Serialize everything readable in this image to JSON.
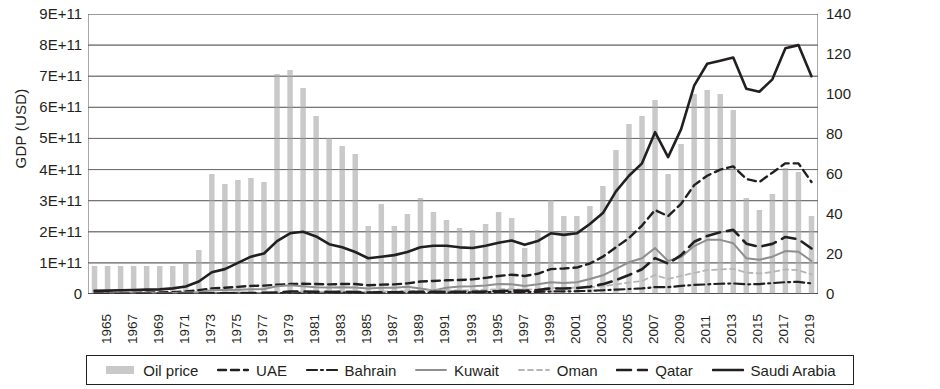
{
  "axes": {
    "y_left_title": "GDP (USD)",
    "y_right_title": "Oil price (USD @2020 prices)",
    "y_left_ticks": [
      "0",
      "1E+11",
      "2E+11",
      "3E+11",
      "4E+11",
      "5E+11",
      "6E+11",
      "7E+11",
      "8E+11",
      "9E+11"
    ],
    "y_right_ticks": [
      "0",
      "20",
      "40",
      "60",
      "80",
      "100",
      "120",
      "140"
    ],
    "x_ticks": [
      "1965",
      "1967",
      "1969",
      "1971",
      "1973",
      "1975",
      "1977",
      "1979",
      "1981",
      "1983",
      "1985",
      "1987",
      "1989",
      "1991",
      "1993",
      "1995",
      "1997",
      "1999",
      "2001",
      "2003",
      "2005",
      "2007",
      "2009",
      "2011",
      "2013",
      "2015",
      "2017",
      "2019"
    ]
  },
  "legend": {
    "items": [
      {
        "label": "Oil price",
        "style": "bar",
        "color": "#c9c9c9"
      },
      {
        "label": "UAE",
        "style": "dashed",
        "color": "#231f20"
      },
      {
        "label": "Bahrain",
        "style": "dashdot",
        "color": "#231f20"
      },
      {
        "label": "Kuwait",
        "style": "solid",
        "color": "#8f8f8f"
      },
      {
        "label": "Oman",
        "style": "dashed-light",
        "color": "#b5b5b5"
      },
      {
        "label": "Qatar",
        "style": "longdash",
        "color": "#231f20"
      },
      {
        "label": "Saudi Arabia",
        "style": "solid-thick",
        "color": "#231f20"
      }
    ]
  },
  "chart_data": {
    "type": "bar",
    "title": "",
    "xlabel": "",
    "ylabel": "GDP (USD)",
    "y2label": "Oil price (USD @2020 prices)",
    "ylim": [
      0,
      900000000000
    ],
    "y2lim": [
      0,
      140
    ],
    "grid": true,
    "legend_position": "bottom",
    "x": [
      1965,
      1966,
      1967,
      1968,
      1969,
      1970,
      1971,
      1972,
      1973,
      1974,
      1975,
      1976,
      1977,
      1978,
      1979,
      1980,
      1981,
      1982,
      1983,
      1984,
      1985,
      1986,
      1987,
      1988,
      1989,
      1990,
      1991,
      1992,
      1993,
      1994,
      1995,
      1996,
      1997,
      1998,
      1999,
      2000,
      2001,
      2002,
      2003,
      2004,
      2005,
      2006,
      2007,
      2008,
      2009,
      2010,
      2011,
      2012,
      2013,
      2014,
      2015,
      2016,
      2017,
      2018,
      2019,
      2020
    ],
    "bars": {
      "name": "Oil price",
      "axis": "right",
      "unit": "USD @2020 prices",
      "values": [
        14,
        14,
        14,
        14,
        14,
        14,
        14,
        15,
        22,
        60,
        55,
        57,
        58,
        56,
        110,
        112,
        103,
        89,
        78,
        74,
        70,
        34,
        45,
        34,
        40,
        48,
        41,
        37,
        33,
        32,
        35,
        41,
        38,
        23,
        32,
        47,
        39,
        39,
        44,
        54,
        72,
        85,
        89,
        97,
        60,
        75,
        100,
        102,
        100,
        92,
        48,
        42,
        50,
        63,
        61,
        39
      ]
    },
    "series": [
      {
        "name": "UAE",
        "axis": "left",
        "style": "dashed",
        "color": "#231f20",
        "values": [
          2000000000,
          2500000000,
          3000000000,
          3500000000,
          4000000000,
          5000000000,
          6000000000,
          8000000000,
          12000000000,
          18000000000,
          20000000000,
          23000000000,
          26000000000,
          27000000000,
          30000000000,
          32000000000,
          33000000000,
          32000000000,
          31000000000,
          32000000000,
          32000000000,
          28000000000,
          30000000000,
          31000000000,
          34000000000,
          40000000000,
          42000000000,
          44000000000,
          45000000000,
          47000000000,
          52000000000,
          58000000000,
          62000000000,
          58000000000,
          65000000000,
          80000000000,
          82000000000,
          85000000000,
          98000000000,
          120000000000,
          150000000000,
          180000000000,
          220000000000,
          270000000000,
          250000000000,
          290000000000,
          350000000000,
          380000000000,
          400000000000,
          410000000000,
          370000000000,
          360000000000,
          390000000000,
          420000000000,
          420000000000,
          360000000000
        ]
      },
      {
        "name": "Bahrain",
        "axis": "left",
        "style": "dashdot",
        "color": "#231f20",
        "values": [
          500000000,
          500000000,
          600000000,
          600000000,
          700000000,
          800000000,
          900000000,
          1000000000,
          1200000000,
          1800000000,
          2000000000,
          2300000000,
          2600000000,
          2800000000,
          3000000000,
          3500000000,
          3800000000,
          3900000000,
          4000000000,
          4100000000,
          4200000000,
          3800000000,
          4000000000,
          4200000000,
          4400000000,
          4800000000,
          5000000000,
          5200000000,
          5400000000,
          5600000000,
          6000000000,
          6500000000,
          6800000000,
          6500000000,
          7000000000,
          8000000000,
          8500000000,
          9000000000,
          10000000000,
          12000000000,
          14000000000,
          16000000000,
          18000000000,
          22000000000,
          22000000000,
          26000000000,
          29000000000,
          31000000000,
          33000000000,
          34000000000,
          31000000000,
          32000000000,
          35000000000,
          38000000000,
          39000000000,
          34000000000
        ]
      },
      {
        "name": "Kuwait",
        "axis": "left",
        "style": "solid",
        "color": "#8f8f8f",
        "values": [
          2000000000,
          2200000000,
          2400000000,
          2700000000,
          2900000000,
          3000000000,
          3500000000,
          4500000000,
          6000000000,
          12000000000,
          13000000000,
          14000000000,
          15000000000,
          16000000000,
          25000000000,
          28000000000,
          25000000000,
          22000000000,
          21000000000,
          22000000000,
          21000000000,
          18000000000,
          20000000000,
          20000000000,
          23000000000,
          18000000000,
          11000000000,
          20000000000,
          24000000000,
          25000000000,
          27000000000,
          32000000000,
          31000000000,
          26000000000,
          31000000000,
          38000000000,
          35000000000,
          38000000000,
          48000000000,
          60000000000,
          81000000000,
          102000000000,
          115000000000,
          148000000000,
          106000000000,
          119000000000,
          154000000000,
          174000000000,
          174000000000,
          163000000000,
          115000000000,
          110000000000,
          120000000000,
          138000000000,
          136000000000,
          106000000000
        ]
      },
      {
        "name": "Oman",
        "axis": "left",
        "style": "dashed-light",
        "color": "#b5b5b5",
        "values": [
          100000000,
          150000000,
          200000000,
          300000000,
          400000000,
          500000000,
          600000000,
          700000000,
          900000000,
          1800000000,
          2000000000,
          2300000000,
          2500000000,
          2600000000,
          3000000000,
          5900000000,
          6800000000,
          7000000000,
          7500000000,
          8000000000,
          9000000000,
          7000000000,
          8000000000,
          8000000000,
          9000000000,
          11000000000,
          11500000000,
          12000000000,
          11500000000,
          12000000000,
          13800000000,
          15300000000,
          15800000000,
          14000000000,
          16000000000,
          19500000000,
          19900000000,
          20300000000,
          21700000000,
          24800000000,
          31100000000,
          37000000000,
          42000000000,
          60900000000,
          48400000000,
          58600000000,
          67900000000,
          76700000000,
          78800000000,
          81100000000,
          68900000000,
          66000000000,
          70600000000,
          79300000000,
          76300000000,
          63400000000
        ]
      },
      {
        "name": "Qatar",
        "axis": "left",
        "style": "longdash",
        "color": "#231f20",
        "values": [
          100000000,
          150000000,
          200000000,
          250000000,
          300000000,
          400000000,
          500000000,
          700000000,
          1000000000,
          2400000000,
          2500000000,
          3000000000,
          3200000000,
          3500000000,
          4800000000,
          7800000000,
          8100000000,
          7400000000,
          6600000000,
          6700000000,
          6000000000,
          4800000000,
          5400000000,
          5400000000,
          6300000000,
          7400000000,
          6900000000,
          7100000000,
          7000000000,
          7200000000,
          8100000000,
          9100000000,
          11300000000,
          10400000000,
          12400000000,
          17800000000,
          17500000000,
          19400000000,
          23500000000,
          31700000000,
          44500000000,
          60900000000,
          79700000000,
          115300000000,
          97800000000,
          125100000000,
          167800000000,
          186800000000,
          198700000000,
          206200000000,
          161700000000,
          151700000000,
          161100000000,
          183300000000,
          175800000000,
          146400000000
        ]
      },
      {
        "name": "Saudi Arabia",
        "axis": "left",
        "style": "solid-thick",
        "color": "#231f20",
        "values": [
          10000000000,
          11000000000,
          12000000000,
          13000000000,
          14000000000,
          15000000000,
          18000000000,
          24000000000,
          40000000000,
          70000000000,
          80000000000,
          100000000000,
          120000000000,
          130000000000,
          170000000000,
          195000000000,
          200000000000,
          185000000000,
          160000000000,
          150000000000,
          135000000000,
          115000000000,
          120000000000,
          125000000000,
          135000000000,
          150000000000,
          155000000000,
          155000000000,
          150000000000,
          148000000000,
          155000000000,
          165000000000,
          172000000000,
          158000000000,
          170000000000,
          195000000000,
          190000000000,
          195000000000,
          225000000000,
          260000000000,
          330000000000,
          380000000000,
          420000000000,
          520000000000,
          440000000000,
          530000000000,
          670000000000,
          740000000000,
          750000000000,
          760000000000,
          660000000000,
          650000000000,
          690000000000,
          790000000000,
          800000000000,
          700000000000
        ]
      }
    ]
  }
}
